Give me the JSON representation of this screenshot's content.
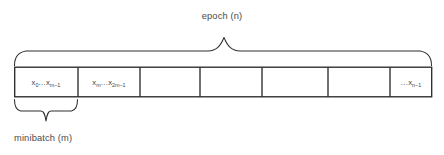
{
  "diagram": {
    "background_color": "#ffffff",
    "stroke_color": "#2b2b2b",
    "text_color": "#4a4a4a"
  },
  "top_brace": {
    "label": "epoch (n)",
    "span_start_px": 14,
    "span_end_px": 432,
    "peak_px": 224
  },
  "bottom_brace": {
    "label": "minibatch (m)",
    "span_start_px": 14,
    "span_end_px": 78,
    "peak_px": 46
  },
  "sequence": {
    "cell_count": 7,
    "box_left_px": 14,
    "box_right_px": 432,
    "box_top_px": 67,
    "box_bottom_px": 97,
    "divider_positions_px": [
      78,
      140,
      200,
      262,
      328,
      390
    ],
    "cells": [
      {
        "index": 0,
        "label": "x0...xm-1",
        "parts": [
          {
            "var": "x",
            "sub": "0"
          },
          {
            "dots": "..."
          },
          {
            "var": "x",
            "sub": "m−1"
          }
        ],
        "empty": false
      },
      {
        "index": 1,
        "label": "xm...x2m-1",
        "parts": [
          {
            "var": "x",
            "sub": "m"
          },
          {
            "dots": "..."
          },
          {
            "var": "x",
            "sub": "2m−1"
          }
        ],
        "empty": false
      },
      {
        "index": 2,
        "label": "",
        "parts": [],
        "empty": true
      },
      {
        "index": 3,
        "label": "",
        "parts": [],
        "empty": true
      },
      {
        "index": 4,
        "label": "",
        "parts": [],
        "empty": true
      },
      {
        "index": 5,
        "label": "",
        "parts": [],
        "empty": true
      },
      {
        "index": 6,
        "label": "...xn-1",
        "parts": [
          {
            "dots": "..."
          },
          {
            "var": "x",
            "sub": "n−1"
          }
        ],
        "empty": false
      }
    ]
  }
}
